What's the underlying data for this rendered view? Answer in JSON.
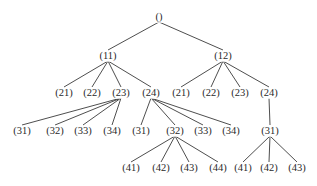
{
  "diagram": {
    "type": "tree",
    "colors": {
      "line": "#3a3a3a",
      "text": "#2a2a2a",
      "background": "#ffffff"
    },
    "nodes": [
      {
        "id": "root",
        "label": "()",
        "x": 159,
        "y": 17,
        "parent": null
      },
      {
        "id": "n11",
        "label": "(11)",
        "x": 108,
        "y": 56,
        "parent": "root"
      },
      {
        "id": "n12",
        "label": "(12)",
        "x": 223,
        "y": 56,
        "parent": "root"
      },
      {
        "id": "n11_21",
        "label": "(21)",
        "x": 64,
        "y": 93,
        "parent": "n11"
      },
      {
        "id": "n11_22",
        "label": "(22)",
        "x": 92,
        "y": 93,
        "parent": "n11"
      },
      {
        "id": "n11_23",
        "label": "(23)",
        "x": 121,
        "y": 93,
        "parent": "n11"
      },
      {
        "id": "n11_24",
        "label": "(24)",
        "x": 151,
        "y": 93,
        "parent": "n11"
      },
      {
        "id": "n12_21",
        "label": "(21)",
        "x": 181,
        "y": 93,
        "parent": "n12"
      },
      {
        "id": "n12_22",
        "label": "(22)",
        "x": 211,
        "y": 93,
        "parent": "n12"
      },
      {
        "id": "n12_23",
        "label": "(23)",
        "x": 240,
        "y": 93,
        "parent": "n12"
      },
      {
        "id": "n12_24",
        "label": "(24)",
        "x": 269,
        "y": 93,
        "parent": "n12"
      },
      {
        "id": "n23_31",
        "label": "(31)",
        "x": 22,
        "y": 131,
        "parent": "n11_23"
      },
      {
        "id": "n23_32",
        "label": "(32)",
        "x": 55,
        "y": 131,
        "parent": "n11_23"
      },
      {
        "id": "n23_33",
        "label": "(33)",
        "x": 83,
        "y": 131,
        "parent": "n11_23"
      },
      {
        "id": "n23_34",
        "label": "(34)",
        "x": 112,
        "y": 131,
        "parent": "n11_23"
      },
      {
        "id": "n24_31",
        "label": "(31)",
        "x": 141,
        "y": 131,
        "parent": "n11_24"
      },
      {
        "id": "n24_32",
        "label": "(32)",
        "x": 175,
        "y": 131,
        "parent": "n11_24"
      },
      {
        "id": "n24_33",
        "label": "(33)",
        "x": 203,
        "y": 131,
        "parent": "n11_24"
      },
      {
        "id": "n24_34",
        "label": "(34)",
        "x": 231,
        "y": 131,
        "parent": "n11_24"
      },
      {
        "id": "n12_24_31",
        "label": "(31)",
        "x": 270,
        "y": 131,
        "parent": "n12_24"
      },
      {
        "id": "n32_41",
        "label": "(41)",
        "x": 131,
        "y": 168,
        "parent": "n24_32"
      },
      {
        "id": "n32_42",
        "label": "(42)",
        "x": 161,
        "y": 168,
        "parent": "n24_32"
      },
      {
        "id": "n32_43",
        "label": "(43)",
        "x": 189,
        "y": 168,
        "parent": "n24_32"
      },
      {
        "id": "n32_44",
        "label": "(44)",
        "x": 218,
        "y": 168,
        "parent": "n24_32"
      },
      {
        "id": "n31_41",
        "label": "(41)",
        "x": 243,
        "y": 168,
        "parent": "n12_24_31"
      },
      {
        "id": "n31_42",
        "label": "(42)",
        "x": 269,
        "y": 168,
        "parent": "n12_24_31"
      },
      {
        "id": "n31_43",
        "label": "(43)",
        "x": 297,
        "y": 168,
        "parent": "n12_24_31"
      }
    ]
  }
}
